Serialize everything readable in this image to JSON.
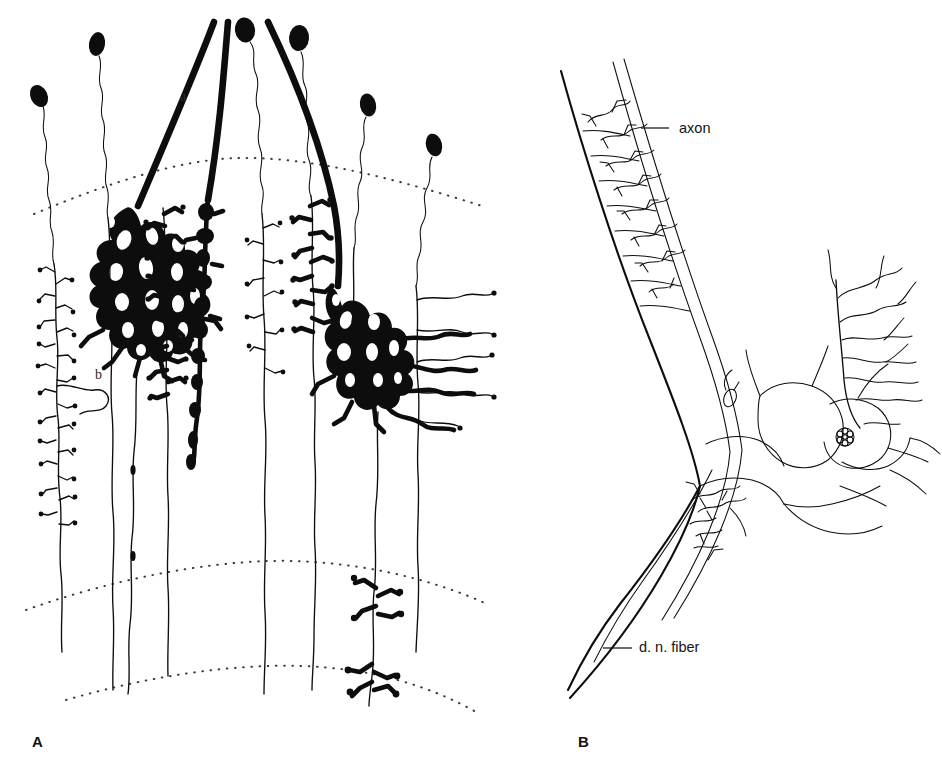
{
  "figure": {
    "background_color": "#ffffff",
    "ink_color": "#0d0d0d",
    "width": 942,
    "height": 767
  },
  "panels": [
    {
      "id": "A",
      "letter": "A",
      "letter_pos": {
        "x": 32,
        "y": 747
      },
      "description": "Golgi-stained cortical/cerebellar neurons with somata, descending wavy axons, dendritic arborizations and dotted laminar boundary arcs",
      "callouts": [
        {
          "key": "a",
          "label": "a",
          "x": 180,
          "y": 101,
          "target": "thick-fiber"
        },
        {
          "key": "b",
          "label": "b",
          "x": 95,
          "y": 379,
          "target": "dendritic-arborization"
        }
      ],
      "somata": [
        {
          "index": 0,
          "x": 39,
          "y": 96,
          "rx": 8,
          "ry": 11,
          "rot": -24
        },
        {
          "index": 1,
          "x": 97,
          "y": 44,
          "rx": 8,
          "ry": 12,
          "rot": 10
        },
        {
          "index": 2,
          "x": 245,
          "y": 30,
          "rx": 10,
          "ry": 12,
          "rot": -8
        },
        {
          "index": 3,
          "x": 299,
          "y": 38,
          "rx": 10,
          "ry": 13,
          "rot": 4
        },
        {
          "index": 4,
          "x": 368,
          "y": 105,
          "rx": 8,
          "ry": 11,
          "rot": -12
        },
        {
          "index": 5,
          "x": 434,
          "y": 145,
          "rx": 8,
          "ry": 11,
          "rot": -14
        }
      ],
      "laminar_arcs": [
        {
          "index": 0,
          "name": "upper-boundary"
        },
        {
          "index": 1,
          "name": "middle-boundary"
        },
        {
          "index": 2,
          "name": "lower-boundary"
        }
      ],
      "neuron_count": 8
    },
    {
      "id": "B",
      "letter": "B",
      "letter_pos": {
        "x": 578,
        "y": 747
      },
      "description": "Detail of myelinated nerve fiber with nodes of Ranvier, terminal arborizations and a cell with rosette nucleus",
      "callouts": [
        {
          "key": "axon",
          "label": "axon",
          "x": 679,
          "y": 133,
          "leader": {
            "x1": 669,
            "y1": 128,
            "x2": 641,
            "y2": 128
          }
        },
        {
          "key": "dn_fiber",
          "label": "d. n. fiber",
          "x": 639,
          "y": 652,
          "leader": {
            "x1": 632,
            "y1": 648,
            "x2": 603,
            "y2": 648
          }
        }
      ],
      "nucleus": {
        "x": 845,
        "y": 437,
        "r": 9,
        "name": "rosette-nucleus"
      }
    }
  ]
}
